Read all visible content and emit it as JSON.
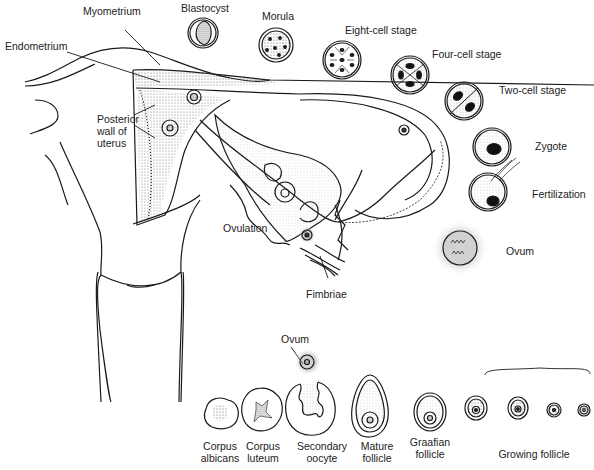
{
  "diagram": {
    "colors": {
      "line": "#1a1a1a",
      "stipple": "#555555",
      "background": "#ffffff"
    }
  },
  "labels": {
    "myometrium": "Myometrium",
    "endometrium": "Endometrium",
    "posterior_wall": "Posterior wall of uterus",
    "blastocyst": "Blastocyst",
    "morula": "Morula",
    "eight_cell": "Eight-cell stage",
    "four_cell": "Four-cell stage",
    "two_cell": "Two-cell stage",
    "zygote": "Zygote",
    "fertilization": "Fertilization",
    "ovum_tube": "Ovum",
    "ovulation": "Ovulation",
    "fimbriae": "Fimbriae",
    "ovum_released": "Ovum"
  },
  "ovary_sequence": [
    {
      "label_line1": "Corpus",
      "label_line2": "albicans"
    },
    {
      "label_line1": "Corpus",
      "label_line2": "luteum"
    },
    {
      "label_line1": "Secondary",
      "label_line2": "oocyte"
    },
    {
      "label_line1": "Mature",
      "label_line2": "follicle"
    },
    {
      "label_line1": "Graafian",
      "label_line2": "follicle"
    }
  ],
  "growing_follicle_label": "Growing follicle",
  "embryo_stages_order": [
    "Ovum",
    "Fertilization",
    "Zygote",
    "Two-cell stage",
    "Four-cell stage",
    "Eight-cell stage",
    "Morula",
    "Blastocyst"
  ]
}
